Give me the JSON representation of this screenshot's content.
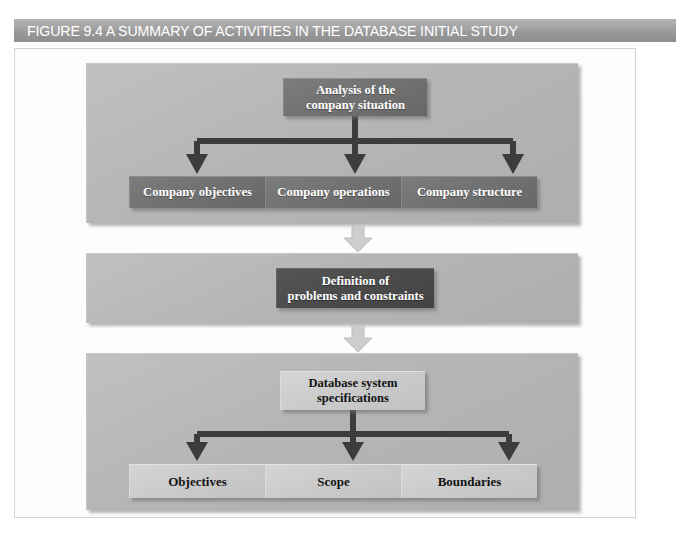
{
  "figure": {
    "number": "FIGURE 9.4",
    "title": "A SUMMARY OF ACTIVITIES IN THE DATABASE INITIAL STUDY",
    "caption_full": "FIGURE 9.4  A SUMMARY OF ACTIVITIES IN THE DATABASE INITIAL STUDY"
  },
  "colors": {
    "caption_bar": "#a2a2a2",
    "caption_text": "#ffffff",
    "panel_background": "#b6b6b6",
    "node_dark": "#717171",
    "node_darker": "#4b4b4b",
    "node_light": "#cacaca",
    "connector_line": "#3c3c3c",
    "stage_arrow": "#c9c9c9",
    "page_background": "#ffffff"
  },
  "diagram": {
    "type": "flowchart",
    "stages": [
      {
        "id": "stage-1",
        "root": {
          "id": "node-analysis",
          "style": "dark",
          "lines": [
            "Analysis of the",
            "company situation"
          ]
        },
        "children": [
          {
            "id": "node-company-objectives",
            "style": "dark",
            "lines": [
              "Company objectives"
            ]
          },
          {
            "id": "node-company-operations",
            "style": "dark",
            "lines": [
              "Company operations"
            ]
          },
          {
            "id": "node-company-structure",
            "style": "dark",
            "lines": [
              "Company structure"
            ]
          }
        ]
      },
      {
        "id": "stage-2",
        "root": {
          "id": "node-definition",
          "style": "darker",
          "lines": [
            "Definition of",
            "problems and constraints"
          ]
        },
        "children": []
      },
      {
        "id": "stage-3",
        "root": {
          "id": "node-db-specs",
          "style": "light",
          "lines": [
            "Database system",
            "specifications"
          ]
        },
        "children": [
          {
            "id": "node-objectives",
            "style": "light",
            "lines": [
              "Objectives"
            ]
          },
          {
            "id": "node-scope",
            "style": "light",
            "lines": [
              "Scope"
            ]
          },
          {
            "id": "node-boundaries",
            "style": "light",
            "lines": [
              "Boundaries"
            ]
          }
        ]
      }
    ],
    "stage_connectors": [
      {
        "id": "stage-arrow-1",
        "icon": "down-block-arrow-icon",
        "from": "stage-1",
        "to": "stage-2"
      },
      {
        "id": "stage-arrow-2",
        "icon": "down-block-arrow-icon",
        "from": "stage-2",
        "to": "stage-3"
      }
    ]
  }
}
